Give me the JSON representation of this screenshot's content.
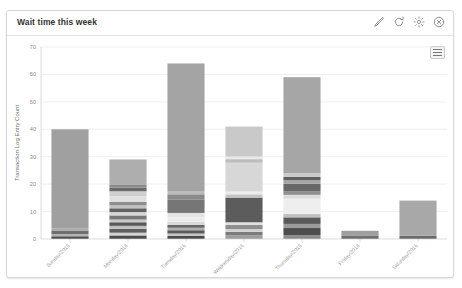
{
  "panel": {
    "title": "Wait time this week",
    "tools": [
      {
        "name": "edit-icon",
        "label": "Edit"
      },
      {
        "name": "refresh-icon",
        "label": "Refresh"
      },
      {
        "name": "settings-icon",
        "label": "Settings"
      },
      {
        "name": "close-icon",
        "label": "Close"
      }
    ],
    "menu_button_label": "Chart context menu"
  },
  "chart_data": {
    "type": "bar",
    "title": "Wait time this week",
    "xlabel": "",
    "ylabel": "Transaction Log Entry Count",
    "ylim": [
      0,
      70
    ],
    "yticks": [
      0,
      10,
      20,
      30,
      40,
      50,
      60,
      70
    ],
    "grid": true,
    "legend": "none",
    "stacked": true,
    "categories": [
      "Sunday/2016",
      "Monday/2016",
      "Tuesday/2016",
      "Wednesday/2016",
      "Thursday/2016",
      "Friday/2016",
      "Saturday/2016"
    ],
    "values": [
      40,
      29,
      64,
      41,
      59,
      3,
      14
    ],
    "bars": [
      {
        "category": "Sunday/2016",
        "total": 40,
        "segments": [
          {
            "value": 1.0,
            "color": "#4f4f4f"
          },
          {
            "value": 0.8,
            "color": "#b5b5b5"
          },
          {
            "value": 1.2,
            "color": "#6e6e6e"
          },
          {
            "value": 0.9,
            "color": "#a8a8a8"
          },
          {
            "value": 36.1,
            "color": "#a0a0a0"
          }
        ]
      },
      {
        "category": "Monday/2016",
        "total": 29,
        "segments": [
          {
            "value": 1.3,
            "color": "#4b4b4b"
          },
          {
            "value": 1.0,
            "color": "#d2d2d2"
          },
          {
            "value": 1.4,
            "color": "#5e5e5e"
          },
          {
            "value": 1.1,
            "color": "#bdbdbd"
          },
          {
            "value": 1.3,
            "color": "#575757"
          },
          {
            "value": 1.0,
            "color": "#c9c9c9"
          },
          {
            "value": 1.5,
            "color": "#777777"
          },
          {
            "value": 1.2,
            "color": "#d6d6d6"
          },
          {
            "value": 1.4,
            "color": "#626262"
          },
          {
            "value": 1.1,
            "color": "#c2c2c2"
          },
          {
            "value": 1.3,
            "color": "#8d8d8d"
          },
          {
            "value": 2.0,
            "color": "#e1e1e1"
          },
          {
            "value": 1.8,
            "color": "#cfcfcf"
          },
          {
            "value": 1.3,
            "color": "#6a6a6a"
          },
          {
            "value": 1.0,
            "color": "#8b8b8b"
          },
          {
            "value": 9.3,
            "color": "#aeaeae"
          }
        ]
      },
      {
        "category": "Tuesday/2016",
        "total": 64,
        "segments": [
          {
            "value": 1.1,
            "color": "#4a4a4a"
          },
          {
            "value": 0.9,
            "color": "#c6c6c6"
          },
          {
            "value": 1.2,
            "color": "#5a5a5a"
          },
          {
            "value": 0.9,
            "color": "#b0b0b0"
          },
          {
            "value": 1.1,
            "color": "#666666"
          },
          {
            "value": 1.0,
            "color": "#d9d9d9"
          },
          {
            "value": 1.8,
            "color": "#ededed"
          },
          {
            "value": 1.5,
            "color": "#e3e3e3"
          },
          {
            "value": 4.8,
            "color": "#767676"
          },
          {
            "value": 2.0,
            "color": "#8a8a8a"
          },
          {
            "value": 1.2,
            "color": "#bbbbbb"
          },
          {
            "value": 46.5,
            "color": "#a4a4a4"
          }
        ]
      },
      {
        "category": "Wednesday/2016",
        "total": 41,
        "segments": [
          {
            "value": 1.4,
            "color": "#9e9e9e"
          },
          {
            "value": 1.2,
            "color": "#7b7b7b"
          },
          {
            "value": 1.0,
            "color": "#d3d3d3"
          },
          {
            "value": 1.5,
            "color": "#8f8f8f"
          },
          {
            "value": 1.0,
            "color": "#e0e0e0"
          },
          {
            "value": 9.0,
            "color": "#5c5c5c"
          },
          {
            "value": 1.2,
            "color": "#c4c4c4"
          },
          {
            "value": 1.0,
            "color": "#ececec"
          },
          {
            "value": 10.5,
            "color": "#d7d7d7"
          },
          {
            "value": 1.3,
            "color": "#bcbcbc"
          },
          {
            "value": 1.0,
            "color": "#e8e8e8"
          },
          {
            "value": 10.9,
            "color": "#c9c9c9"
          }
        ]
      },
      {
        "category": "Thursday/2016",
        "total": 59,
        "segments": [
          {
            "value": 1.4,
            "color": "#8c8c8c"
          },
          {
            "value": 2.6,
            "color": "#4e4e4e"
          },
          {
            "value": 1.5,
            "color": "#9b9b9b"
          },
          {
            "value": 2.4,
            "color": "#5a5a5a"
          },
          {
            "value": 1.2,
            "color": "#c0c0c0"
          },
          {
            "value": 5.6,
            "color": "#eeeeee"
          },
          {
            "value": 1.4,
            "color": "#dcdcdc"
          },
          {
            "value": 1.2,
            "color": "#8f8f8f"
          },
          {
            "value": 2.8,
            "color": "#686868"
          },
          {
            "value": 1.4,
            "color": "#a6a6a6"
          },
          {
            "value": 1.2,
            "color": "#5f5f5f"
          },
          {
            "value": 1.3,
            "color": "#cacaca"
          },
          {
            "value": 35.0,
            "color": "#a6a6a6"
          }
        ]
      },
      {
        "category": "Friday/2016",
        "total": 3,
        "segments": [
          {
            "value": 1.3,
            "color": "#6f6f6f"
          },
          {
            "value": 1.7,
            "color": "#9f9f9f"
          }
        ]
      },
      {
        "category": "Saturday/2016",
        "total": 14,
        "segments": [
          {
            "value": 1.2,
            "color": "#6b6b6b"
          },
          {
            "value": 12.8,
            "color": "#a8a8a8"
          }
        ]
      }
    ]
  }
}
